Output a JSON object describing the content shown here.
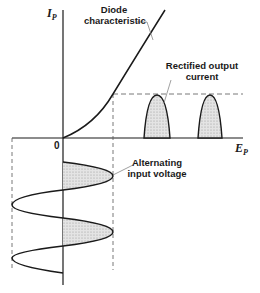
{
  "diagram": {
    "axes": {
      "y_label": "I",
      "y_subscript": "P",
      "x_label": "E",
      "x_subscript": "P",
      "origin_label": "0"
    },
    "annotations": {
      "diode_line1": "Diode",
      "diode_line2": "characteristic",
      "rectified_line1": "Rectified output",
      "rectified_line2": "current",
      "alternating_line1": "Alternating",
      "alternating_line2": "input voltage"
    },
    "colors": {
      "line": "#1a1a1a",
      "shade": "#d9d9d9",
      "dash": "#555555"
    }
  }
}
